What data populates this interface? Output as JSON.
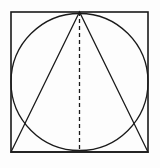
{
  "figure": {
    "background_color": "#fdfdfd",
    "stroke_color": "#1a1a1a",
    "fill_color": "none",
    "stroke_width": 1.3,
    "canvas": {
      "width": 160,
      "height": 168
    },
    "shapes": {
      "square": {
        "label": "square",
        "x": 11,
        "y": 12,
        "width": 137,
        "height": 140,
        "stroke": "#1a1a1a",
        "stroke_width": 1.6,
        "fill": "none"
      },
      "circle": {
        "label": "inscribed-circle",
        "cx": 79.5,
        "cy": 82,
        "r": 68.5,
        "stroke": "#1a1a1a",
        "stroke_width": 1.3,
        "fill": "none"
      },
      "triangle": {
        "label": "inscribed-triangle",
        "points": "79.5,12 11,152 148,152",
        "apex": {
          "x": 79.5,
          "y": 12
        },
        "base_left": {
          "x": 11,
          "y": 152
        },
        "base_right": {
          "x": 148,
          "y": 152
        },
        "stroke": "#1a1a1a",
        "stroke_width": 1.3,
        "fill": "none"
      },
      "altitude": {
        "label": "dashed-altitude",
        "x1": 79.5,
        "y1": 12,
        "x2": 79.5,
        "y2": 152,
        "stroke": "#1a1a1a",
        "stroke_width": 1.3,
        "dash_pattern": "4 3"
      }
    }
  }
}
